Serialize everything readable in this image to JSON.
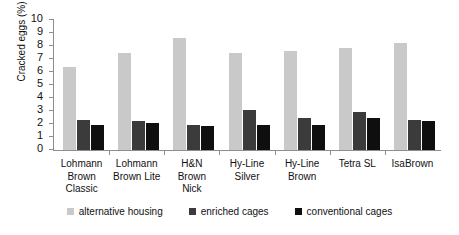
{
  "chart_data": {
    "type": "bar",
    "title": "",
    "xlabel": "",
    "ylabel": "Cracked eggs (%)",
    "ylim": [
      0,
      10
    ],
    "yticks": [
      0,
      1,
      2,
      3,
      4,
      5,
      6,
      7,
      8,
      9,
      10
    ],
    "grid": false,
    "legend_position": "bottom",
    "categories": [
      "Lohmann Brown Classic",
      "Lohmann Brown Lite",
      "H&N Brown Nick",
      "Hy-Line Silver",
      "Hy-Line Brown",
      "Tetra SL",
      "IsaBrown"
    ],
    "category_lines": [
      [
        "Lohmann",
        "Brown",
        "Classic"
      ],
      [
        "Lohmann",
        "Brown Lite"
      ],
      [
        "H&N",
        "Brown",
        "Nick"
      ],
      [
        "Hy-Line",
        "Silver"
      ],
      [
        "Hy-Line",
        "Brown"
      ],
      [
        "Tetra SL"
      ],
      [
        "IsaBrown"
      ]
    ],
    "series": [
      {
        "name": "alternative housing",
        "color": "#c9c9c9",
        "values": [
          6.35,
          7.5,
          8.6,
          7.5,
          7.6,
          7.85,
          8.25
        ]
      },
      {
        "name": "enriched cages",
        "color": "#3b3b3b",
        "values": [
          2.3,
          2.25,
          1.95,
          3.1,
          2.45,
          2.9,
          2.3
        ]
      },
      {
        "name": "conventional cages",
        "color": "#0f0f0f",
        "values": [
          1.95,
          2.05,
          1.85,
          1.9,
          1.9,
          2.5,
          2.2
        ]
      }
    ]
  },
  "legend": {
    "items": [
      {
        "label": "alternative housing",
        "color": "#c9c9c9"
      },
      {
        "label": "enriched cages",
        "color": "#3b3b3b"
      },
      {
        "label": "conventional cages",
        "color": "#0f0f0f"
      }
    ]
  }
}
